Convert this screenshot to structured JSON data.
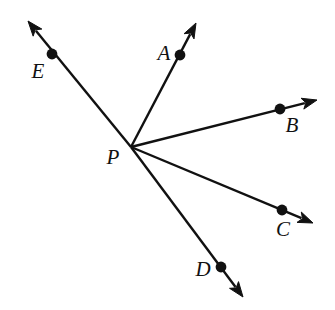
{
  "diagram": {
    "type": "geometric-ray-diagram",
    "background_color": "#ffffff",
    "stroke_color": "#111111",
    "line_width": 2.4,
    "dot_radius": 5.4,
    "label_font_size": 21,
    "canvas": {
      "width": 335,
      "height": 310
    },
    "vertex": {
      "name": "P",
      "label": "P",
      "x": 131,
      "y": 147,
      "label_x": 113,
      "label_y": 157
    },
    "rays": [
      {
        "name": "ray-PE",
        "label": "E",
        "point_x": 52,
        "point_y": 54,
        "tip_x": 28,
        "tip_y": 21,
        "label_x": 38,
        "label_y": 71,
        "angle_deg": 136.6
      },
      {
        "name": "ray-PA",
        "label": "A",
        "point_x": 180,
        "point_y": 55,
        "tip_x": 196,
        "tip_y": 23,
        "label_x": 164,
        "label_y": 53,
        "angle_deg": 65.8
      },
      {
        "name": "ray-PB",
        "label": "B",
        "point_x": 280,
        "point_y": 109,
        "tip_x": 317,
        "tip_y": 100,
        "label_x": 292,
        "label_y": 125,
        "angle_deg": 14.8
      },
      {
        "name": "ray-PC",
        "label": "C",
        "point_x": 282,
        "point_y": 210,
        "tip_x": 313,
        "tip_y": 223,
        "label_x": 283,
        "label_y": 229,
        "angle_deg": -22.6
      },
      {
        "name": "ray-PD",
        "label": "D",
        "point_x": 221,
        "point_y": 267,
        "tip_x": 243,
        "tip_y": 297,
        "label_x": 203,
        "label_y": 269,
        "angle_deg": -58.4
      }
    ]
  }
}
